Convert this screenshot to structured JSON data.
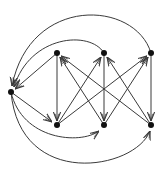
{
  "diagram": {
    "type": "directed-graph",
    "colors": {
      "edge": "#3a3a3a",
      "node": "#111111",
      "background": "#ffffff"
    },
    "nodes": [
      {
        "id": "L",
        "x": 11,
        "y": 92
      },
      {
        "id": "T1",
        "x": 57,
        "y": 53
      },
      {
        "id": "T2",
        "x": 104,
        "y": 53
      },
      {
        "id": "T3",
        "x": 151,
        "y": 53
      },
      {
        "id": "B1",
        "x": 57,
        "y": 125
      },
      {
        "id": "B2",
        "x": 104,
        "y": 125
      },
      {
        "id": "B3",
        "x": 151,
        "y": 125
      }
    ],
    "edges": [
      {
        "from": "T1",
        "to": "L",
        "shape": "straight"
      },
      {
        "from": "T2",
        "to": "L",
        "shape": "arc"
      },
      {
        "from": "T3",
        "to": "L",
        "shape": "outer-arc"
      },
      {
        "from": "L",
        "to": "B1",
        "shape": "straight"
      },
      {
        "from": "L",
        "to": "B2",
        "shape": "arc"
      },
      {
        "from": "L",
        "to": "B3",
        "shape": "outer-arc"
      },
      {
        "from": "T1",
        "to": "B1",
        "shape": "straight"
      },
      {
        "from": "T2",
        "to": "B2",
        "shape": "straight"
      },
      {
        "from": "T3",
        "to": "B3",
        "shape": "straight"
      },
      {
        "from": "B1",
        "to": "T2",
        "shape": "straight"
      },
      {
        "from": "B1",
        "to": "T3",
        "shape": "straight"
      },
      {
        "from": "B2",
        "to": "T1",
        "shape": "straight"
      },
      {
        "from": "B2",
        "to": "T3",
        "shape": "straight"
      },
      {
        "from": "B3",
        "to": "T1",
        "shape": "straight"
      },
      {
        "from": "B3",
        "to": "T2",
        "shape": "straight"
      }
    ]
  }
}
